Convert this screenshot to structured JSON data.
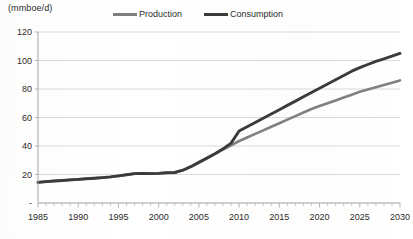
{
  "chart_data": {
    "type": "line",
    "title": "",
    "subtitle": "",
    "unit_label": "(mmboe/d)",
    "xlabel": "",
    "ylabel": "",
    "xlim": [
      1985,
      2030
    ],
    "ylim": [
      0,
      120
    ],
    "grid": true,
    "legend_position": "top",
    "y_ticks": [
      "-",
      "20",
      "40",
      "60",
      "80",
      "100",
      "120"
    ],
    "y_tick_values": [
      0,
      20,
      40,
      60,
      80,
      100,
      120
    ],
    "x_ticks": [
      "1985",
      "1990",
      "1995",
      "2000",
      "2005",
      "2010",
      "2015",
      "2020",
      "2025",
      "2030"
    ],
    "x_tick_values": [
      1985,
      1990,
      1995,
      2000,
      2005,
      2010,
      2015,
      2020,
      2025,
      2030
    ],
    "x": [
      1985,
      1986,
      1987,
      1988,
      1989,
      1990,
      1991,
      1992,
      1993,
      1994,
      1995,
      1996,
      1997,
      1998,
      1999,
      2000,
      2001,
      2002,
      2003,
      2004,
      2005,
      2006,
      2007,
      2008,
      2009,
      2010,
      2011,
      2012,
      2013,
      2014,
      2015,
      2016,
      2017,
      2018,
      2019,
      2020,
      2021,
      2022,
      2023,
      2024,
      2025,
      2026,
      2027,
      2028,
      2029,
      2030
    ],
    "series": [
      {
        "name": "Production",
        "color": "#808080",
        "values": [
          14.5,
          15.0,
          15.4,
          15.8,
          16.2,
          16.6,
          17.0,
          17.4,
          17.8,
          18.3,
          19.0,
          19.8,
          20.6,
          20.8,
          20.6,
          20.8,
          21.2,
          21.4,
          23.0,
          25.5,
          28.5,
          31.5,
          34.5,
          37.5,
          40.5,
          43.5,
          46.0,
          48.5,
          51.0,
          53.5,
          56.0,
          58.5,
          61.0,
          63.5,
          66.0,
          68.0,
          70.0,
          72.0,
          74.0,
          76.0,
          78.0,
          79.6,
          81.2,
          82.8,
          84.4,
          86.0
        ]
      },
      {
        "name": "Consumption",
        "color": "#3b3b3b",
        "values": [
          14.5,
          15.0,
          15.4,
          15.8,
          16.2,
          16.6,
          17.0,
          17.4,
          17.8,
          18.3,
          19.0,
          19.8,
          20.6,
          20.8,
          20.6,
          20.8,
          21.2,
          21.4,
          23.0,
          25.5,
          28.5,
          31.5,
          34.5,
          38.0,
          42.0,
          50.5,
          53.5,
          56.5,
          59.5,
          62.5,
          65.5,
          68.5,
          71.5,
          74.5,
          77.5,
          80.5,
          83.5,
          86.5,
          89.5,
          92.5,
          95.0,
          97.2,
          99.4,
          101.2,
          103.0,
          105.0
        ]
      }
    ],
    "legend": [
      {
        "label": "Production",
        "color": "#808080"
      },
      {
        "label": "Consumption",
        "color": "#3b3b3b"
      }
    ]
  },
  "layout": {
    "plot_left": 38,
    "plot_right": 400,
    "plot_top": 32,
    "plot_bottom": 203
  }
}
